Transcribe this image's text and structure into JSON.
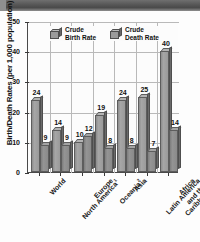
{
  "chart_data": {
    "type": "bar",
    "title": "",
    "xlabel": "",
    "ylabel": "Birth/Death Rates (per 1,000 population)",
    "ylim": [
      0,
      50
    ],
    "yticks": [
      0,
      10,
      20,
      30,
      40,
      50
    ],
    "grid": true,
    "legend_position": "top-center",
    "categories": [
      "World",
      "North America",
      "Europe",
      "Oceania",
      "Asia",
      "Latin America and the Caribbean",
      "Africa"
    ],
    "category_display": [
      {
        "lines": [
          "World"
        ],
        "footnote": ""
      },
      {
        "lines": [
          "North America"
        ],
        "footnote": "1"
      },
      {
        "lines": [
          "Europe"
        ],
        "footnote": ""
      },
      {
        "lines": [
          "Oceania"
        ],
        "footnote": "2"
      },
      {
        "lines": [
          "Asia"
        ],
        "footnote": ""
      },
      {
        "lines": [
          "Latin America",
          "and the",
          "Caribbean"
        ],
        "footnote": ""
      },
      {
        "lines": [
          "Africa"
        ],
        "footnote": ""
      }
    ],
    "series": [
      {
        "name": "Crude Birth Rate",
        "values": [
          24,
          14,
          10,
          19,
          24,
          25,
          40
        ]
      },
      {
        "name": "Crude Death Rate",
        "values": [
          9,
          9,
          12,
          8,
          8,
          7,
          14
        ]
      }
    ]
  },
  "legend": {
    "items": [
      {
        "line1": "Crude",
        "line2": "Birth Rate"
      },
      {
        "line1": "Crude",
        "line2": "Death Rate"
      }
    ]
  },
  "colors": {
    "birth_bar": "#a6a6a6",
    "death_bar": "#949494",
    "grid": "#b9b9b9",
    "axis": "#4a4a4a",
    "text": "#111111",
    "background": "#fdfdfd",
    "scan_band": "#555555"
  }
}
